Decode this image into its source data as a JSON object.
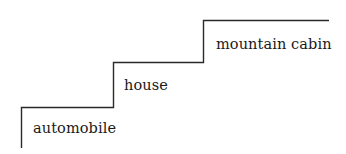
{
  "diagram": {
    "type": "staircase",
    "line_color": "#2a2a2a",
    "text_color": "#1a1a1a",
    "steps": [
      {
        "label": "automobile",
        "level": 1
      },
      {
        "label": "house",
        "level": 2
      },
      {
        "label": "mountain cabin",
        "level": 3
      }
    ]
  }
}
